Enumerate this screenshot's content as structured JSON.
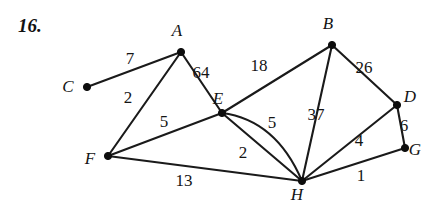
{
  "problem": {
    "number_label": "16."
  },
  "figure": {
    "type": "weighted-graph",
    "background_color": "#ffffff",
    "line_color": "#1a1a1a",
    "vertices": [
      {
        "id": "A",
        "label": "A",
        "x": 181,
        "y": 52,
        "label_x": 177,
        "label_y": 36
      },
      {
        "id": "B",
        "label": "B",
        "x": 332,
        "y": 45,
        "label_x": 328,
        "label_y": 29
      },
      {
        "id": "C",
        "label": "C",
        "x": 87,
        "y": 87,
        "label_x": 68,
        "label_y": 92
      },
      {
        "id": "D",
        "label": "D",
        "x": 397,
        "y": 105,
        "label_x": 410,
        "label_y": 102
      },
      {
        "id": "E",
        "label": "E",
        "x": 222,
        "y": 113,
        "label_x": 218,
        "label_y": 104
      },
      {
        "id": "F",
        "label": "F",
        "x": 108,
        "y": 156,
        "label_x": 90,
        "label_y": 164
      },
      {
        "id": "G",
        "label": "G",
        "x": 405,
        "y": 148,
        "label_x": 415,
        "label_y": 155
      },
      {
        "id": "H",
        "label": "H",
        "x": 302,
        "y": 181,
        "label_x": 297,
        "label_y": 200
      }
    ],
    "edges": [
      {
        "id": "C-A",
        "from": "C",
        "to": "A",
        "weight": "7",
        "curved": false,
        "label_x": 130,
        "label_y": 64
      },
      {
        "id": "A-F",
        "from": "A",
        "to": "F",
        "weight": "2",
        "curved": false,
        "label_x": 128,
        "label_y": 103
      },
      {
        "id": "A-E",
        "from": "A",
        "to": "E",
        "weight": "64",
        "curved": false,
        "label_x": 201,
        "label_y": 78
      },
      {
        "id": "E-B",
        "from": "E",
        "to": "B",
        "weight": "18",
        "curved": false,
        "label_x": 259,
        "label_y": 71
      },
      {
        "id": "B-D",
        "from": "B",
        "to": "D",
        "weight": "26",
        "curved": false,
        "label_x": 364,
        "label_y": 73
      },
      {
        "id": "F-E",
        "from": "F",
        "to": "E",
        "weight": "5",
        "curved": false,
        "label_x": 164,
        "label_y": 127
      },
      {
        "id": "E-H-straight",
        "from": "E",
        "to": "H",
        "weight": "2",
        "curved": false,
        "label_x": 243,
        "label_y": 158
      },
      {
        "id": "E-H-curved",
        "from": "E",
        "to": "H",
        "weight": "5",
        "curved": true,
        "label_x": 272,
        "label_y": 128
      },
      {
        "id": "B-H",
        "from": "B",
        "to": "H",
        "weight": "37",
        "curved": false,
        "label_x": 316,
        "label_y": 120
      },
      {
        "id": "D-H",
        "from": "D",
        "to": "H",
        "weight": "4",
        "curved": false,
        "label_x": 359,
        "label_y": 146
      },
      {
        "id": "D-G",
        "from": "D",
        "to": "G",
        "weight": "6",
        "curved": false,
        "label_x": 404,
        "label_y": 131
      },
      {
        "id": "G-H",
        "from": "G",
        "to": "H",
        "weight": "1",
        "curved": false,
        "label_x": 361,
        "label_y": 181
      },
      {
        "id": "F-H",
        "from": "F",
        "to": "H",
        "weight": "13",
        "curved": false,
        "label_x": 184,
        "label_y": 186
      }
    ],
    "curve_control": {
      "x": 276,
      "y": 120
    }
  }
}
